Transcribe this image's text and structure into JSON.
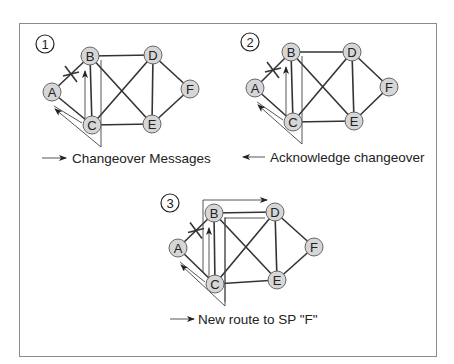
{
  "diagram": {
    "title": "",
    "panels": [
      {
        "step": "1",
        "legend": "Changeover Messages",
        "legend_arrow": "right",
        "nodes": {
          "A": [
            52,
            92
          ],
          "B": [
            90,
            56
          ],
          "C": [
            92,
            125
          ],
          "D": [
            153,
            55
          ],
          "E": [
            152,
            124
          ],
          "F": [
            190,
            89
          ]
        },
        "step_pos": [
          45,
          44
        ],
        "legend_pos": [
          72,
          163
        ],
        "arrow_pos": [
          42,
          158
        ]
      },
      {
        "step": "2",
        "legend": "Acknowledge changeover",
        "legend_arrow": "left",
        "nodes": {
          "A": [
            255,
            88
          ],
          "B": [
            291,
            52
          ],
          "C": [
            293,
            122
          ],
          "D": [
            352,
            52
          ],
          "E": [
            354,
            121
          ],
          "F": [
            389,
            87
          ]
        },
        "step_pos": [
          250,
          42
        ],
        "legend_pos": [
          270,
          162
        ],
        "arrow_pos": [
          243,
          157
        ]
      },
      {
        "step": "3",
        "legend": "New route to SP \"F\"",
        "legend_arrow": "right",
        "nodes": {
          "A": [
            178,
            248
          ],
          "B": [
            214,
            213
          ],
          "C": [
            215,
            284
          ],
          "D": [
            275,
            212
          ],
          "E": [
            277,
            280
          ],
          "F": [
            314,
            247
          ]
        },
        "step_pos": [
          170,
          203
        ],
        "legend_pos": [
          198,
          324
        ],
        "arrow_pos": [
          170,
          319
        ]
      }
    ],
    "links": [
      [
        "A",
        "B"
      ],
      [
        "A",
        "C"
      ],
      [
        "B",
        "C"
      ],
      [
        "B",
        "D"
      ],
      [
        "B",
        "E"
      ],
      [
        "C",
        "D"
      ],
      [
        "C",
        "E"
      ],
      [
        "D",
        "E"
      ],
      [
        "D",
        "F"
      ],
      [
        "E",
        "F"
      ]
    ],
    "failed_link": [
      "A",
      "B"
    ],
    "colors": {
      "node_fill": "#d6d6d6",
      "node_stroke": "#666666",
      "link": "#333333",
      "frame": "#8a8a8a"
    }
  }
}
